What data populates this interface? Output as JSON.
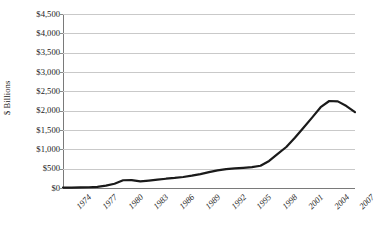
{
  "chart_data": {
    "type": "line",
    "title": "",
    "xlabel": "",
    "ylabel": "$ Billions",
    "ylim": [
      0,
      4500
    ],
    "ytick_values": [
      0,
      500,
      1000,
      1500,
      2000,
      2500,
      3000,
      3500,
      4000,
      4500
    ],
    "ytick_labels": [
      "$0",
      "$500",
      "$1,000",
      "$1,500",
      "$2,000",
      "$2,500",
      "$3,000",
      "$3,500",
      "$4,000",
      "$4,500"
    ],
    "xlim": [
      1974,
      2008
    ],
    "xtick_values": [
      1974,
      1977,
      1980,
      1983,
      1986,
      1989,
      1992,
      1995,
      1998,
      2001,
      2004,
      2007
    ],
    "xtick_labels": [
      "1974",
      "1977",
      "1980",
      "1983",
      "1986",
      "1989",
      "1992",
      "1995",
      "1998",
      "2001",
      "2004",
      "2007"
    ],
    "grid": true,
    "grid_axis": "y",
    "legend": false,
    "legend_position": "none",
    "line_color": "#1a1a1a",
    "line_width": 2.2,
    "gridline_color": "#c9c9c9",
    "x": [
      1974,
      1975,
      1976,
      1977,
      1978,
      1979,
      1980,
      1981,
      1982,
      1983,
      1984,
      1985,
      1986,
      1987,
      1988,
      1989,
      1990,
      1991,
      1992,
      1993,
      1994,
      1995,
      1996,
      1997,
      1998,
      1999,
      2000,
      2001,
      2002,
      2003,
      2004,
      2005,
      2006,
      2007,
      2008
    ],
    "values": [
      10,
      12,
      15,
      20,
      30,
      60,
      110,
      200,
      205,
      170,
      190,
      215,
      240,
      260,
      285,
      320,
      360,
      410,
      455,
      490,
      505,
      520,
      540,
      575,
      700,
      880,
      1060,
      1300,
      1560,
      1820,
      2090,
      2250,
      2240,
      2120,
      1960
    ]
  },
  "axis": {
    "y_title": "$ Billions"
  },
  "caption": {
    "text": ""
  }
}
